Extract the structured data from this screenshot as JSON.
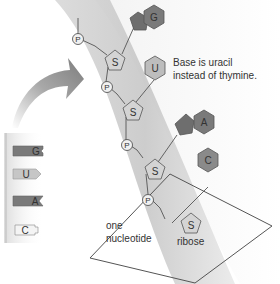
{
  "diagram": {
    "colors": {
      "band_outer": "#e6e6e6",
      "band_inner": "#cfcfcf",
      "dark_base": "#7a7a7a",
      "light_base": "#bdbdbd",
      "sugar_fill": "#d4d4d4",
      "stroke": "#555555",
      "text": "#333333",
      "arrow": "#8a8a8a"
    },
    "annotations": {
      "uracil_note_line1": "Base is uracil",
      "uracil_note_line2": "instead of thymine.",
      "nucleotide_label_line1": "one",
      "nucleotide_label_line2": "nucleotide",
      "ribose_label": "ribose"
    },
    "phosphate_label": "P",
    "sugar_label": "S",
    "backbone": [
      {
        "phosphate": "P",
        "sugar": "S",
        "base": "G",
        "base_shade": "dark"
      },
      {
        "phosphate": "P",
        "sugar": "S",
        "base": "U",
        "base_shade": "light"
      },
      {
        "phosphate": "P",
        "sugar": "S",
        "base": "A",
        "base_shade": "dark"
      },
      {
        "phosphate": "P",
        "sugar": "S",
        "base": "C",
        "base_shade": "dark"
      }
    ],
    "legend_strand": [
      {
        "base": "G",
        "shade": "dark"
      },
      {
        "base": "U",
        "shade": "light"
      },
      {
        "base": "A",
        "shade": "dark"
      },
      {
        "base": "C",
        "shade": "white"
      }
    ]
  }
}
